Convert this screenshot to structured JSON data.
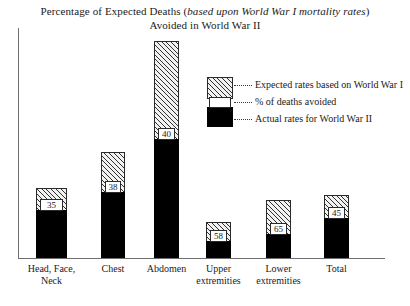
{
  "title": {
    "line1_prefix": "Percentage of Expected Deaths (",
    "line1_italic": "based upon World War I mortality rates",
    "line1_suffix": ")",
    "line2": "Avoided in World War II"
  },
  "legend": {
    "items": [
      {
        "label": "Expected rates based on World War I",
        "swatch": "hatched"
      },
      {
        "label": "% of deaths avoided",
        "swatch": "white-box"
      },
      {
        "label": "Actual rates for World War II",
        "swatch": "black"
      }
    ]
  },
  "chart_data": {
    "type": "bar",
    "title": "Percentage of Expected Deaths (based upon World War I mortality rates) Avoided in World War II",
    "xlabel": "",
    "ylabel": "",
    "grid": false,
    "legend_position": "inside-upper-right",
    "categories": [
      "Head, Face, Neck",
      "Chest",
      "Abdomen",
      "Upper extremities",
      "Lower extremities",
      "Total"
    ],
    "series": [
      {
        "name": "% of deaths avoided",
        "values": [
          35,
          38,
          40,
          58,
          65,
          45
        ]
      }
    ],
    "annotations": [
      {
        "category": "Head, Face, Neck",
        "label": "35"
      },
      {
        "category": "Chest",
        "label": "38"
      },
      {
        "category": "Abdomen",
        "label": "40"
      },
      {
        "category": "Upper extremities",
        "label": "58"
      },
      {
        "category": "Lower extremities",
        "label": "65"
      },
      {
        "category": "Total",
        "label": "45"
      }
    ]
  },
  "bars": [
    {
      "name": "Head, Face, Neck",
      "label_line1": "Head, Face,",
      "label_line2": "Neck",
      "value": "35",
      "left": 36,
      "width": 31,
      "total_height": 70,
      "actual_height": 48
    },
    {
      "name": "Chest",
      "label_line1": "Chest",
      "label_line2": "",
      "value": "38",
      "left": 101,
      "width": 24,
      "total_height": 106,
      "actual_height": 66
    },
    {
      "name": "Abdomen",
      "label_line1": "Abdomen",
      "label_line2": "",
      "value": "40",
      "left": 154,
      "width": 25,
      "total_height": 217,
      "actual_height": 119
    },
    {
      "name": "Upper extremities",
      "label_line1": "Upper",
      "label_line2": "extremities",
      "value": "58",
      "left": 206,
      "width": 25,
      "total_height": 36,
      "actual_height": 17
    },
    {
      "name": "Lower extremities",
      "label_line1": "Lower",
      "label_line2": "extremities",
      "value": "65",
      "left": 266,
      "width": 25,
      "total_height": 58,
      "actual_height": 24
    },
    {
      "name": "Total",
      "label_line1": "Total",
      "label_line2": "",
      "value": "45",
      "left": 324,
      "width": 25,
      "total_height": 63,
      "actual_height": 40
    }
  ]
}
